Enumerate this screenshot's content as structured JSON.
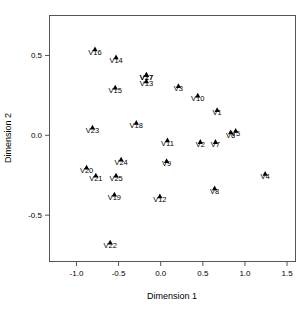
{
  "chart_data": {
    "type": "scatter",
    "title": "",
    "xlabel": "Dimension 1",
    "ylabel": "Dimension 2",
    "xlim": [
      -1.32,
      1.6
    ],
    "ylim": [
      -0.79,
      0.75
    ],
    "xticks": [
      "-1.0",
      "-0.5",
      "0.0",
      "0.5",
      "1.0",
      "1.5"
    ],
    "xtick_values": [
      -1.0,
      -0.5,
      0.0,
      0.5,
      1.0,
      1.5
    ],
    "yticks": [
      "0.5",
      "0.0",
      "-0.5"
    ],
    "ytick_values": [
      0.5,
      0.0,
      -0.5
    ],
    "grid": false,
    "legend": null,
    "marker": "filled-triangle",
    "marker_color": "#000000",
    "points": [
      {
        "label": "V1",
        "x": 0.67,
        "y": 0.16
      },
      {
        "label": "V2",
        "x": 0.47,
        "y": -0.04
      },
      {
        "label": "V3",
        "x": 0.21,
        "y": 0.31
      },
      {
        "label": "V4",
        "x": 1.24,
        "y": -0.24
      },
      {
        "label": "V5",
        "x": 0.89,
        "y": 0.03
      },
      {
        "label": "V6",
        "x": 0.83,
        "y": 0.02
      },
      {
        "label": "V7",
        "x": 0.65,
        "y": -0.04
      },
      {
        "label": "V8",
        "x": 0.64,
        "y": -0.33
      },
      {
        "label": "V9",
        "x": 0.07,
        "y": -0.16
      },
      {
        "label": "V10",
        "x": 0.44,
        "y": 0.25
      },
      {
        "label": "V11",
        "x": 0.08,
        "y": -0.03
      },
      {
        "label": "V12",
        "x": -0.01,
        "y": -0.38
      },
      {
        "label": "V13",
        "x": -0.17,
        "y": 0.34
      },
      {
        "label": "V14",
        "x": -0.53,
        "y": 0.49
      },
      {
        "label": "V15",
        "x": -0.54,
        "y": 0.3
      },
      {
        "label": "V16",
        "x": -0.78,
        "y": 0.54
      },
      {
        "label": "V17",
        "x": -0.17,
        "y": 0.38
      },
      {
        "label": "V18",
        "x": -0.29,
        "y": 0.08
      },
      {
        "label": "V19",
        "x": -0.55,
        "y": -0.37
      },
      {
        "label": "V20",
        "x": -0.88,
        "y": -0.2
      },
      {
        "label": "V21",
        "x": -0.77,
        "y": -0.25
      },
      {
        "label": "V22",
        "x": -0.6,
        "y": -0.67
      },
      {
        "label": "V23",
        "x": -0.81,
        "y": 0.05
      },
      {
        "label": "V24",
        "x": -0.47,
        "y": -0.15
      },
      {
        "label": "V25",
        "x": -0.53,
        "y": -0.25
      },
      {
        "label": "V27",
        "x": -0.17,
        "y": 0.38
      }
    ]
  }
}
